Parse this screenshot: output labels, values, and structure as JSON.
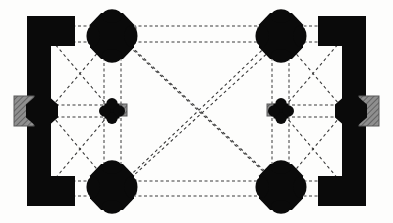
{
  "diagram": {
    "title": "Architectural floor plan",
    "subject": "Hall church / vaulted rectangular hall plan",
    "projection": "plan",
    "canvas": {
      "width": 393,
      "height": 223
    },
    "colors": {
      "background": "#fdfdfc",
      "masonry_solid": "#0a0a0a",
      "hatch_fill": "#8c8c8c",
      "hatch_stroke": "#5a5a5a",
      "rib_line": "#3a3a3a",
      "paper_edge": "#f4f4f2"
    },
    "line_styles": {
      "vault_rib": {
        "style": "dashed",
        "dash": "3 3",
        "width": 1.1
      },
      "arcade_double": {
        "style": "dashed",
        "dash": "3 2.5",
        "width": 1.0
      },
      "wall_outline": {
        "style": "solid",
        "width": 1
      }
    },
    "legend": {
      "solid_black": "masonry cut by section plane (walls and piers)",
      "gray_hatch": "secondary masonry / buttress block",
      "dashed_lines": "vault ribs and transverse arches projected overhead"
    }
  },
  "structure": {
    "outer_wall_note": "Thick solid walls on west and east sides only; north and south sides open arcades",
    "bay_count": "3 bays wide x 2 bays deep",
    "pier_count_free_standing": 6,
    "wall_pier_count": 6
  },
  "walls": [
    {
      "name": "west-wall",
      "label": "West wall",
      "side": "left",
      "x": 27,
      "y": 16,
      "w": 24,
      "h": 190,
      "corner_top": {
        "x": 27,
        "y": 16,
        "w": 48,
        "h": 30
      },
      "corner_bottom": {
        "x": 27,
        "y": 176,
        "w": 48,
        "h": 30
      }
    },
    {
      "name": "east-wall",
      "label": "East wall",
      "side": "right",
      "x": 342,
      "y": 16,
      "w": 24,
      "h": 190,
      "corner_top": {
        "x": 318,
        "y": 16,
        "w": 48,
        "h": 30
      },
      "corner_bottom": {
        "x": 318,
        "y": 176,
        "w": 48,
        "h": 30
      }
    }
  ],
  "piers": [
    {
      "name": "pier-nw",
      "label": "Pier NW",
      "shape": "octagonal-compound",
      "cx": 112,
      "cy": 36,
      "rx": 22,
      "ry": 23
    },
    {
      "name": "pier-ne",
      "label": "Pier NE",
      "shape": "octagonal-compound",
      "cx": 281,
      "cy": 36,
      "rx": 22,
      "ry": 23
    },
    {
      "name": "pier-sw",
      "label": "Pier SW",
      "shape": "octagonal-compound",
      "cx": 112,
      "cy": 187,
      "rx": 22,
      "ry": 23
    },
    {
      "name": "pier-se",
      "label": "Pier SE",
      "shape": "octagonal-compound",
      "cx": 281,
      "cy": 187,
      "rx": 22,
      "ry": 23
    },
    {
      "name": "pier-mid-west",
      "label": "Small pier west",
      "shape": "quatrefoil",
      "cx": 112,
      "cy": 111,
      "rx": 11,
      "ry": 11
    },
    {
      "name": "pier-mid-east",
      "label": "Small pier east",
      "shape": "quatrefoil",
      "cx": 281,
      "cy": 111,
      "rx": 11,
      "ry": 11
    }
  ],
  "wall_piers": [
    {
      "name": "wall-pier-west-mid",
      "label": "West wall respond",
      "cx": 42,
      "cy": 111,
      "rx": 16,
      "ry": 14
    },
    {
      "name": "wall-pier-east-mid",
      "label": "East wall respond",
      "cx": 351,
      "cy": 111,
      "rx": 16,
      "ry": 14
    }
  ],
  "buttresses": [
    {
      "name": "buttress-west",
      "label": "West buttress (hatched)",
      "x": 14,
      "y": 96,
      "w": 20,
      "h": 30,
      "fill": "hatch"
    },
    {
      "name": "buttress-east",
      "label": "East buttress (hatched)",
      "x": 359,
      "y": 96,
      "w": 20,
      "h": 30,
      "fill": "hatch"
    },
    {
      "name": "buttress-nw-inner",
      "label": "Pier NW shoulder (hatched)",
      "x": 127,
      "y": 27,
      "w": 9,
      "h": 14,
      "fill": "hatch"
    },
    {
      "name": "buttress-ne-inner",
      "label": "Pier NE shoulder (hatched)",
      "x": 258,
      "y": 27,
      "w": 9,
      "h": 14,
      "fill": "hatch"
    },
    {
      "name": "buttress-mid-w-inner",
      "label": "Small pier west shoulder",
      "x": 120,
      "y": 104,
      "w": 7,
      "h": 12,
      "fill": "hatch"
    },
    {
      "name": "buttress-mid-e-inner",
      "label": "Small pier east shoulder",
      "x": 267,
      "y": 104,
      "w": 7,
      "h": 12,
      "fill": "hatch"
    },
    {
      "name": "buttress-sw-inner",
      "label": "Pier SW shoulder (hatched)",
      "x": 127,
      "y": 180,
      "w": 9,
      "h": 14,
      "fill": "hatch"
    },
    {
      "name": "buttress-se-inner",
      "label": "Pier SE shoulder (hatched)",
      "x": 258,
      "y": 180,
      "w": 9,
      "h": 14,
      "fill": "hatch"
    }
  ],
  "ribs": {
    "transverse_pairs": [
      {
        "name": "arch-north-outer",
        "x1": 45,
        "y1": 26,
        "x2": 348,
        "y2": 26
      },
      {
        "name": "arch-north-inner",
        "x1": 45,
        "y1": 42,
        "x2": 348,
        "y2": 42
      },
      {
        "name": "arch-mid-west-outer",
        "x1": 45,
        "y1": 105,
        "x2": 112,
        "y2": 105
      },
      {
        "name": "arch-mid-west-inner",
        "x1": 45,
        "y1": 117,
        "x2": 112,
        "y2": 117
      },
      {
        "name": "arch-mid-east-outer",
        "x1": 281,
        "y1": 105,
        "x2": 348,
        "y2": 105
      },
      {
        "name": "arch-mid-east-inner",
        "x1": 281,
        "y1": 117,
        "x2": 348,
        "y2": 117
      },
      {
        "name": "arch-south-outer",
        "x1": 45,
        "y1": 181,
        "x2": 348,
        "y2": 181
      },
      {
        "name": "arch-south-inner",
        "x1": 45,
        "y1": 196,
        "x2": 348,
        "y2": 196
      }
    ],
    "longitudinal_pairs": [
      {
        "name": "arcade-west-outer",
        "x1": 104,
        "y1": 52,
        "x2": 104,
        "y2": 172
      },
      {
        "name": "arcade-west-inner",
        "x1": 121,
        "y1": 52,
        "x2": 121,
        "y2": 172
      },
      {
        "name": "arcade-east-outer",
        "x1": 272,
        "y1": 52,
        "x2": 272,
        "y2": 172
      },
      {
        "name": "arcade-east-inner",
        "x1": 289,
        "y1": 52,
        "x2": 289,
        "y2": 172
      }
    ],
    "diagonals": [
      {
        "name": "rib-bay-nw-a",
        "x1": 48,
        "y1": 36,
        "x2": 112,
        "y2": 111
      },
      {
        "name": "rib-bay-nw-b",
        "x1": 48,
        "y1": 111,
        "x2": 112,
        "y2": 36
      },
      {
        "name": "rib-bay-sw-a",
        "x1": 48,
        "y1": 111,
        "x2": 112,
        "y2": 187
      },
      {
        "name": "rib-bay-sw-b",
        "x1": 48,
        "y1": 187,
        "x2": 112,
        "y2": 111
      },
      {
        "name": "rib-bay-ne-a",
        "x1": 281,
        "y1": 111,
        "x2": 345,
        "y2": 36
      },
      {
        "name": "rib-bay-ne-b",
        "x1": 281,
        "y1": 36,
        "x2": 345,
        "y2": 111
      },
      {
        "name": "rib-bay-se-a",
        "x1": 281,
        "y1": 111,
        "x2": 345,
        "y2": 187
      },
      {
        "name": "rib-bay-se-b",
        "x1": 281,
        "y1": 187,
        "x2": 345,
        "y2": 111
      },
      {
        "name": "rib-nave-a1",
        "x1": 116,
        "y1": 34,
        "x2": 279,
        "y2": 186
      },
      {
        "name": "rib-nave-a2",
        "x1": 122,
        "y1": 38,
        "x2": 284,
        "y2": 189
      },
      {
        "name": "rib-nave-b1",
        "x1": 116,
        "y1": 189,
        "x2": 279,
        "y2": 34
      },
      {
        "name": "rib-nave-b2",
        "x1": 122,
        "y1": 186,
        "x2": 284,
        "y2": 38
      }
    ]
  }
}
